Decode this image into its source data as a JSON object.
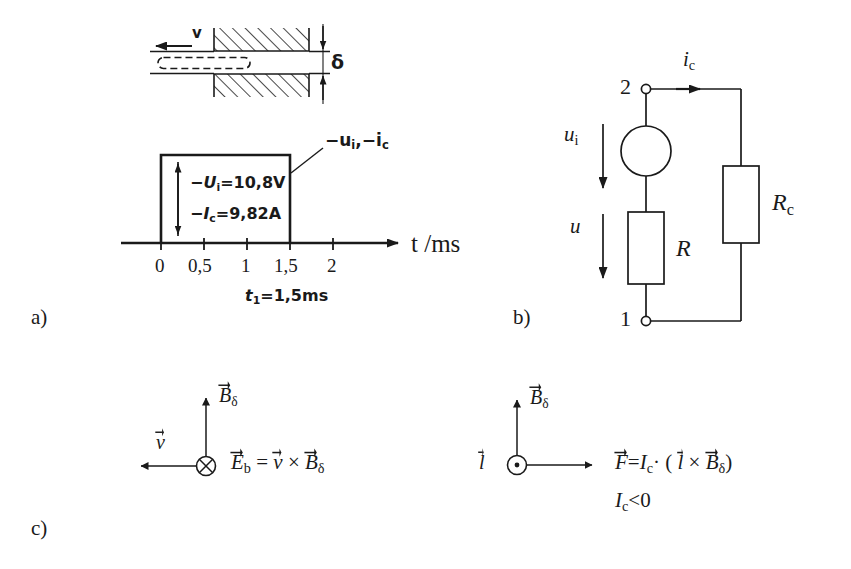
{
  "figure": {
    "panels": {
      "a_label": "a)",
      "b_label": "b)",
      "c_label": "c)"
    },
    "panel_a": {
      "geometry": {
        "velocity_label": "v",
        "gap_label": "δ",
        "hatch_description": "cross-hatched iron core blocks above and below air gap",
        "conductor_description": "dashed rectangle conductor bar in the air gap"
      },
      "pulse_plot": {
        "curve_label": "−u i , −i c",
        "curve_label_parts": {
          "minus_u": "−u",
          "u_sub": "i",
          "comma": ",",
          "minus_i": "−i",
          "i_sub": "c"
        },
        "annotation_voltage": {
          "prefix": "−",
          "symbol": "U",
          "subscript": "i",
          "equals": "=",
          "value": "10,8V"
        },
        "annotation_current": {
          "prefix": "−",
          "symbol": "I",
          "subscript": "c",
          "equals": "=",
          "value": "9,82A"
        },
        "x_axis_label": "t /ms",
        "x_ticks": [
          "0",
          "0,5",
          "1",
          "1,5",
          "2"
        ],
        "pulse_duration_note": {
          "symbol": "t",
          "subscript": "1",
          "equals": "=",
          "value": "1,5ms"
        }
      }
    },
    "panel_b": {
      "terminal_top": "2",
      "terminal_bottom": "1",
      "current_label": {
        "symbol": "i",
        "subscript": "c"
      },
      "source_voltage_label": {
        "symbol": "u",
        "subscript": "i"
      },
      "resistor_voltage_label": "u",
      "resistor_label": "R",
      "load_resistor_label": {
        "symbol": "R",
        "subscript": "c"
      }
    },
    "panel_c": {
      "left": {
        "field_label": {
          "symbol": "B",
          "subscript": "δ"
        },
        "velocity_label": "v",
        "center_marker": "cross-in-circle (into page)",
        "equation": {
          "lhs_symbol": "E",
          "lhs_sub": "b",
          "equals": "=",
          "operand_1": "v",
          "times": "×",
          "operand_2_symbol": "B",
          "operand_2_sub": "δ"
        }
      },
      "right": {
        "field_label": {
          "symbol": "B",
          "subscript": "δ"
        },
        "length_label": "l",
        "center_marker": "dot-in-circle (out of page)",
        "equation": {
          "lhs_symbol": "F",
          "equals": "=",
          "factor_symbol": "I",
          "factor_sub": "c",
          "dot": "·",
          "open_paren": "(",
          "operand_1": "l",
          "times": "×",
          "operand_2_symbol": "B",
          "operand_2_sub": "δ",
          "close_paren": ")"
        },
        "condition": {
          "symbol": "I",
          "subscript": "c",
          "relation": "<0"
        }
      }
    },
    "colors": {
      "ink": "#1a1a1a",
      "background": "#ffffff"
    }
  }
}
